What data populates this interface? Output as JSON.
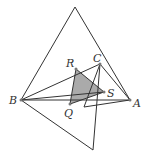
{
  "diagram": {
    "type": "geometry",
    "labels": {
      "A": "A",
      "B": "B",
      "C": "C",
      "Q": "Q",
      "R": "R",
      "S": "S"
    },
    "colors": {
      "line": "#333333",
      "shade": "#aaaaaa",
      "background": "#ffffff"
    },
    "shaded_triangle": [
      "Q",
      "R",
      "S"
    ]
  }
}
